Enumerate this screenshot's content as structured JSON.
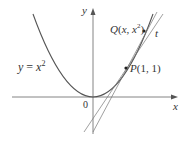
{
  "diagram": {
    "curve_label": "y = x²",
    "curve_label_parts": {
      "y": "y",
      "eq": " = ",
      "x": "x",
      "exp": "2"
    },
    "axis_x_label": "x",
    "axis_y_label": "y",
    "origin_label": "0",
    "point_P": {
      "name": "P",
      "coords": "(1, 1)"
    },
    "point_Q": {
      "name": "Q",
      "coords_open": "(",
      "x": "x",
      "sep": ", ",
      "x2": "x",
      "exp": "2",
      "coords_close": ")"
    },
    "tangent_label": "t",
    "colors": {
      "curve": "#555555",
      "axis": "#555555",
      "text": "#333333"
    }
  }
}
